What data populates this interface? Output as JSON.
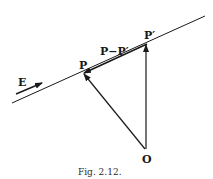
{
  "figure": {
    "caption": "Fig. 2.12.",
    "labels": {
      "E": "E",
      "P": "P",
      "P_prime": "P′",
      "diff": "P−P′",
      "O": "O"
    },
    "points": {
      "line_start": [
        12,
        103
      ],
      "line_end": [
        205,
        16
      ],
      "P": [
        83,
        73
      ],
      "P_prime": [
        147,
        44
      ],
      "O": [
        146,
        150
      ]
    },
    "colors": {
      "ink": "#1a1a1a",
      "background": "#ffffff"
    }
  }
}
